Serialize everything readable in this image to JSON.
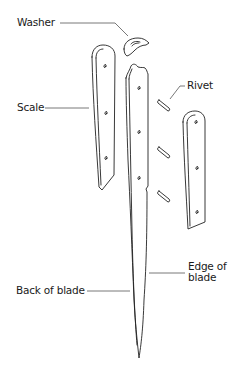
{
  "diagram": {
    "line_color": "#222222",
    "leader_color": "#555555",
    "labels": {
      "washer": "Washer",
      "scale": "Scale",
      "rivet": "Rivet",
      "edge_of_blade": "Edge of\nblade",
      "back_of_blade": "Back of blade"
    },
    "parts": [
      {
        "name": "washer",
        "label": "Washer"
      },
      {
        "name": "left-scale",
        "label": "Scale"
      },
      {
        "name": "blade",
        "label": "Back of blade / Edge of blade"
      },
      {
        "name": "rivets",
        "count": 3,
        "label": "Rivet"
      },
      {
        "name": "right-scale"
      }
    ]
  }
}
